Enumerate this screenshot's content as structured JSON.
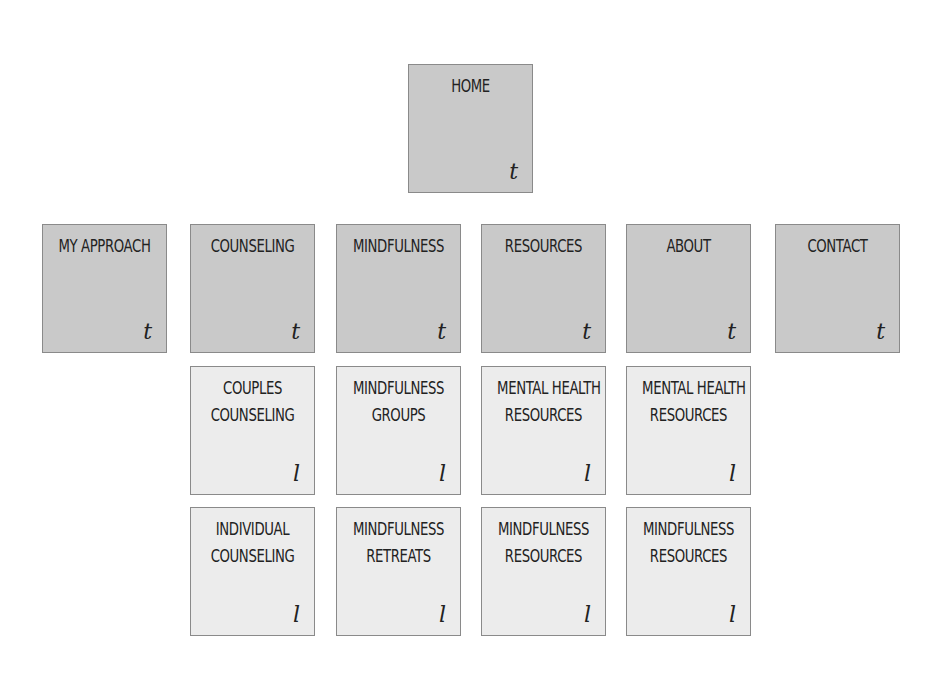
{
  "diagram": {
    "type": "sitemap",
    "root": {
      "title_lines": [
        "HOME"
      ],
      "tag": "t",
      "level": "top"
    },
    "top_level": [
      {
        "title_lines": [
          "MY APPROACH"
        ],
        "tag": "t",
        "level": "top"
      },
      {
        "title_lines": [
          "COUNSELING"
        ],
        "tag": "t",
        "level": "top"
      },
      {
        "title_lines": [
          "MINDFULNESS"
        ],
        "tag": "t",
        "level": "top"
      },
      {
        "title_lines": [
          "RESOURCES"
        ],
        "tag": "t",
        "level": "top"
      },
      {
        "title_lines": [
          "ABOUT"
        ],
        "tag": "t",
        "level": "top"
      },
      {
        "title_lines": [
          "CONTACT"
        ],
        "tag": "t",
        "level": "top"
      }
    ],
    "sub_pages": {
      "counseling": [
        {
          "title_lines": [
            "COUPLES",
            "COUNSELING"
          ],
          "tag": "l",
          "level": "low"
        },
        {
          "title_lines": [
            "INDIVIDUAL",
            "COUNSELING"
          ],
          "tag": "l",
          "level": "low"
        }
      ],
      "mindfulness": [
        {
          "title_lines": [
            "MINDFULNESS",
            "GROUPS"
          ],
          "tag": "l",
          "level": "low"
        },
        {
          "title_lines": [
            "MINDFULNESS",
            "RETREATS"
          ],
          "tag": "l",
          "level": "low"
        }
      ],
      "resources": [
        {
          "title_lines": [
            "MENTAL HEALTH",
            "RESOURCES"
          ],
          "tag": "l",
          "level": "low"
        },
        {
          "title_lines": [
            "MINDFULNESS",
            "RESOURCES"
          ],
          "tag": "l",
          "level": "low"
        }
      ],
      "about": [
        {
          "title_lines": [
            "MENTAL HEALTH",
            "RESOURCES"
          ],
          "tag": "l",
          "level": "low"
        },
        {
          "title_lines": [
            "MINDFULNESS",
            "RESOURCES"
          ],
          "tag": "l",
          "level": "low"
        }
      ]
    },
    "colors": {
      "top_level_fill": "#c9c9c9",
      "low_level_fill": "#ececec",
      "border": "#8a8a8a",
      "text": "#222222"
    }
  }
}
